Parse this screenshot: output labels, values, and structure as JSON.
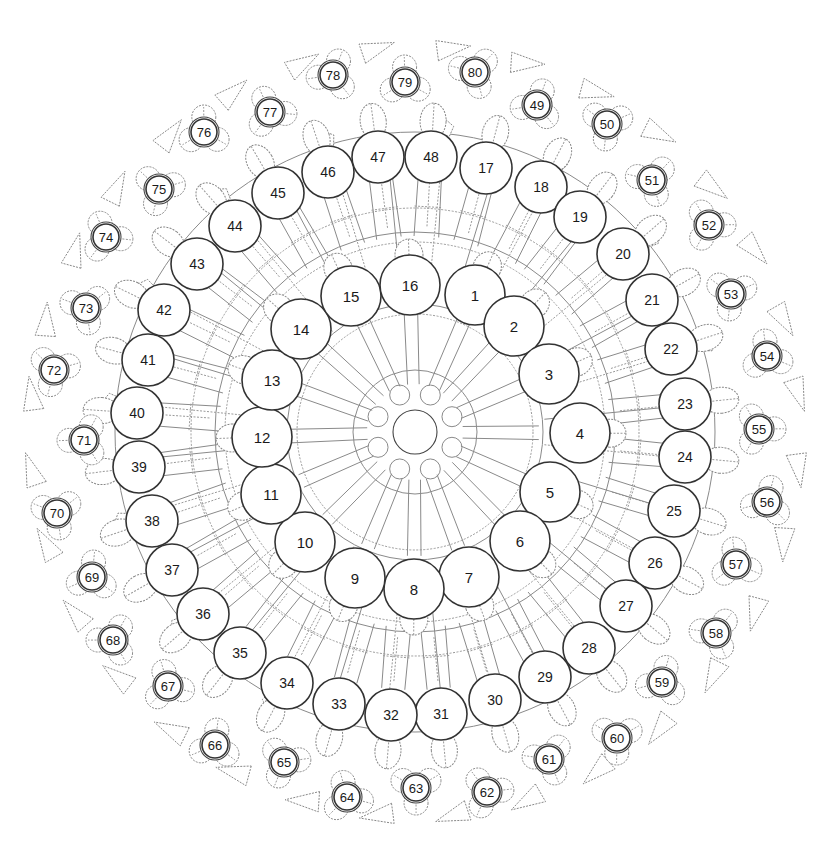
{
  "center": [
    415,
    432
  ],
  "hub": {
    "radius": 22,
    "satellite_radius": 10,
    "satellite_count": 8,
    "satellite_ring": 40
  },
  "inner_ring": {
    "radius_px": 30,
    "medallions": [
      {
        "n": "1",
        "x": 475,
        "y": 295
      },
      {
        "n": "2",
        "x": 514,
        "y": 326
      },
      {
        "n": "3",
        "x": 549,
        "y": 374
      },
      {
        "n": "4",
        "x": 580,
        "y": 433
      },
      {
        "n": "5",
        "x": 550,
        "y": 492
      },
      {
        "n": "6",
        "x": 520,
        "y": 541
      },
      {
        "n": "7",
        "x": 469,
        "y": 577
      },
      {
        "n": "8",
        "x": 414,
        "y": 589
      },
      {
        "n": "9",
        "x": 355,
        "y": 578
      },
      {
        "n": "10",
        "x": 305,
        "y": 542
      },
      {
        "n": "11",
        "x": 271,
        "y": 494
      },
      {
        "n": "12",
        "x": 262,
        "y": 437
      },
      {
        "n": "13",
        "x": 272,
        "y": 380
      },
      {
        "n": "14",
        "x": 301,
        "y": 329
      },
      {
        "n": "15",
        "x": 351,
        "y": 296
      },
      {
        "n": "16",
        "x": 410,
        "y": 285
      }
    ]
  },
  "middle_ring": {
    "radius_px": 26,
    "medallions": [
      {
        "n": "17",
        "x": 486,
        "y": 168
      },
      {
        "n": "18",
        "x": 541,
        "y": 187
      },
      {
        "n": "19",
        "x": 580,
        "y": 217
      },
      {
        "n": "20",
        "x": 623,
        "y": 254
      },
      {
        "n": "21",
        "x": 652,
        "y": 300
      },
      {
        "n": "22",
        "x": 671,
        "y": 349
      },
      {
        "n": "23",
        "x": 685,
        "y": 404
      },
      {
        "n": "24",
        "x": 685,
        "y": 457
      },
      {
        "n": "25",
        "x": 674,
        "y": 511
      },
      {
        "n": "26",
        "x": 655,
        "y": 563
      },
      {
        "n": "27",
        "x": 626,
        "y": 606
      },
      {
        "n": "28",
        "x": 589,
        "y": 648
      },
      {
        "n": "29",
        "x": 545,
        "y": 677
      },
      {
        "n": "30",
        "x": 495,
        "y": 700
      },
      {
        "n": "31",
        "x": 441,
        "y": 714
      },
      {
        "n": "32",
        "x": 391,
        "y": 715
      },
      {
        "n": "33",
        "x": 339,
        "y": 704
      },
      {
        "n": "34",
        "x": 287,
        "y": 683
      },
      {
        "n": "35",
        "x": 240,
        "y": 653
      },
      {
        "n": "36",
        "x": 203,
        "y": 614
      },
      {
        "n": "37",
        "x": 172,
        "y": 570
      },
      {
        "n": "38",
        "x": 152,
        "y": 521
      },
      {
        "n": "39",
        "x": 139,
        "y": 467
      },
      {
        "n": "40",
        "x": 137,
        "y": 413
      },
      {
        "n": "41",
        "x": 148,
        "y": 360
      },
      {
        "n": "42",
        "x": 164,
        "y": 310
      },
      {
        "n": "43",
        "x": 197,
        "y": 264
      },
      {
        "n": "44",
        "x": 235,
        "y": 226
      },
      {
        "n": "45",
        "x": 278,
        "y": 193
      },
      {
        "n": "46",
        "x": 328,
        "y": 172
      },
      {
        "n": "47",
        "x": 378,
        "y": 157
      },
      {
        "n": "48",
        "x": 431,
        "y": 157
      }
    ]
  },
  "outer_ring": {
    "radius_px": 13,
    "medallions": [
      {
        "n": "49",
        "x": 537,
        "y": 105
      },
      {
        "n": "50",
        "x": 607,
        "y": 124
      },
      {
        "n": "51",
        "x": 652,
        "y": 180
      },
      {
        "n": "52",
        "x": 709,
        "y": 225
      },
      {
        "n": "53",
        "x": 731,
        "y": 294
      },
      {
        "n": "54",
        "x": 767,
        "y": 356
      },
      {
        "n": "55",
        "x": 759,
        "y": 429
      },
      {
        "n": "56",
        "x": 767,
        "y": 502
      },
      {
        "n": "57",
        "x": 736,
        "y": 564
      },
      {
        "n": "58",
        "x": 716,
        "y": 633
      },
      {
        "n": "59",
        "x": 662,
        "y": 682
      },
      {
        "n": "60",
        "x": 617,
        "y": 738
      },
      {
        "n": "61",
        "x": 549,
        "y": 759
      },
      {
        "n": "62",
        "x": 487,
        "y": 792
      },
      {
        "n": "63",
        "x": 416,
        "y": 788
      },
      {
        "n": "64",
        "x": 347,
        "y": 797
      },
      {
        "n": "65",
        "x": 284,
        "y": 762
      },
      {
        "n": "66",
        "x": 215,
        "y": 745
      },
      {
        "n": "67",
        "x": 168,
        "y": 686
      },
      {
        "n": "68",
        "x": 113,
        "y": 640
      },
      {
        "n": "69",
        "x": 92,
        "y": 577
      },
      {
        "n": "70",
        "x": 57,
        "y": 513
      },
      {
        "n": "71",
        "x": 84,
        "y": 440
      },
      {
        "n": "72",
        "x": 54,
        "y": 370
      },
      {
        "n": "73",
        "x": 86,
        "y": 308
      },
      {
        "n": "74",
        "x": 106,
        "y": 237
      },
      {
        "n": "75",
        "x": 159,
        "y": 189
      },
      {
        "n": "76",
        "x": 204,
        "y": 132
      },
      {
        "n": "77",
        "x": 270,
        "y": 112
      },
      {
        "n": "78",
        "x": 333,
        "y": 75
      },
      {
        "n": "79",
        "x": 405,
        "y": 82
      },
      {
        "n": "80",
        "x": 475,
        "y": 72
      }
    ]
  },
  "colors": {
    "line": "#8a8a8a",
    "medallion_stroke": "#333333",
    "label": "#1a1a1a",
    "background": "#ffffff"
  }
}
